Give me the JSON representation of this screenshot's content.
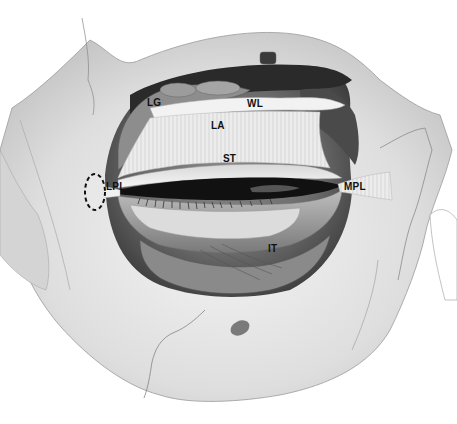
{
  "figure": {
    "labels": [
      {
        "id": "LG",
        "text": "LG",
        "x": 147,
        "y": 98
      },
      {
        "id": "WL",
        "text": "WL",
        "x": 247,
        "y": 99
      },
      {
        "id": "LA",
        "text": "LA",
        "x": 211,
        "y": 121
      },
      {
        "id": "ST",
        "text": "ST",
        "x": 223,
        "y": 154
      },
      {
        "id": "LPL",
        "text": "LPL",
        "x": 106,
        "y": 182
      },
      {
        "id": "MPL",
        "text": "MPL",
        "x": 344,
        "y": 182
      },
      {
        "id": "IT",
        "text": "IT",
        "x": 268,
        "y": 244
      }
    ],
    "highlight": {
      "type": "dashed-ellipse",
      "target": "LPL",
      "cx": 95,
      "cy": 192,
      "rx": 10,
      "ry": 18
    }
  },
  "colors": {
    "background": "#ffffff",
    "bone": "#e6e6e6",
    "bone_shadow": "#bdbdbd",
    "cavity_dark": "#3a3a3a",
    "tissue_mid": "#9a9a9a",
    "tendon_light": "#f0f0f0",
    "label": "#111111"
  }
}
